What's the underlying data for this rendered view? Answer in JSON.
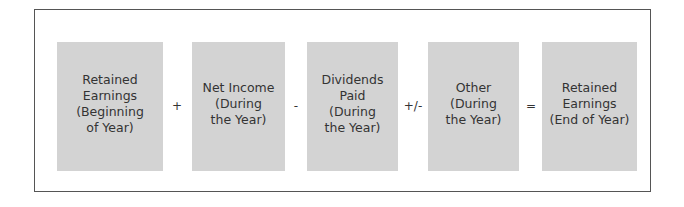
{
  "diagram": {
    "colors": {
      "frame_border": "#555555",
      "box_fill": "#d3d3d3",
      "text": "#333333",
      "background": "#ffffff"
    },
    "terms": [
      {
        "id": "beginning",
        "label": "Retained\nEarnings\n(Beginning\nof Year)"
      },
      {
        "id": "net-income",
        "label": "Net Income\n(During\nthe Year)"
      },
      {
        "id": "dividends",
        "label": "Dividends\nPaid\n(During\nthe Year)"
      },
      {
        "id": "other",
        "label": "Other\n(During\nthe Year)"
      },
      {
        "id": "ending",
        "label": "Retained\nEarnings\n(End of Year)"
      }
    ],
    "operators": [
      "+",
      "-",
      "+/-",
      "="
    ]
  }
}
